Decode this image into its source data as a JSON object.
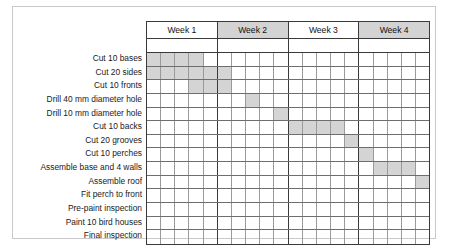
{
  "chart_data": {
    "type": "bar",
    "title": "",
    "xlabel": "",
    "ylabel": "",
    "orientation": "horizontal-gantt",
    "columns_per_week": 5,
    "total_columns": 20,
    "week_headers": [
      {
        "label": "Week 1",
        "shaded": false
      },
      {
        "label": "Week 2",
        "shaded": true
      },
      {
        "label": "Week 3",
        "shaded": false
      },
      {
        "label": "Week 4",
        "shaded": true
      }
    ],
    "categories": [
      "Cut 10 bases",
      "Cut 20 sides",
      "Cut 10 fronts",
      "Drill 40 mm diameter hole",
      "Drill 10 mm diameter hole",
      "Cut 10 backs",
      "Cut 20 grooves",
      "Cut 10 perches",
      "Assemble base and 4 walls",
      "Assemble roof",
      "Fit perch to front",
      "Pre-paint inspection",
      "Paint 10 bird houses",
      "Final inspection"
    ],
    "tasks": [
      {
        "name": "Cut 10 bases",
        "start": 0,
        "duration": 4
      },
      {
        "name": "Cut 20 sides",
        "start": 0,
        "duration": 6
      },
      {
        "name": "Cut 10 fronts",
        "start": 3,
        "duration": 3
      },
      {
        "name": "Drill 40 mm diameter hole",
        "start": 7,
        "duration": 1
      },
      {
        "name": "Drill 10 mm diameter hole",
        "start": 9,
        "duration": 1
      },
      {
        "name": "Cut 10 backs",
        "start": 10,
        "duration": 4
      },
      {
        "name": "Cut 20 grooves",
        "start": 14,
        "duration": 1
      },
      {
        "name": "Cut 10 perches",
        "start": 15,
        "duration": 1
      },
      {
        "name": "Assemble base and 4 walls",
        "start": 16,
        "duration": 3
      },
      {
        "name": "Assemble roof",
        "start": 19,
        "duration": 1
      },
      {
        "name": "Fit perch to front",
        "start": 21,
        "duration": 1
      },
      {
        "name": "Pre-paint inspection",
        "start": 22,
        "duration": 1
      },
      {
        "name": "Paint 10 bird houses",
        "start": 22,
        "duration": 2
      },
      {
        "name": "Final inspection",
        "start": 24,
        "duration": 1
      }
    ],
    "colors": {
      "bar_fill": "#d4d4d4",
      "header_shaded": "#d3d3d3",
      "grid_major": "#3a3a3a",
      "grid_minor": "#9a9a9a",
      "row_line": "#6e6e6e",
      "background": "#ffffff",
      "frame": "#c9c9c9",
      "text": "#1a1a1a"
    },
    "grid": true,
    "legend": null
  }
}
